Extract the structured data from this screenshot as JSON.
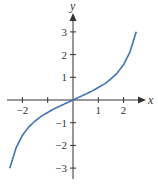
{
  "chart_data": {
    "type": "line",
    "title": "",
    "xlabel": "x",
    "ylabel": "y",
    "xlim": [
      -2.6,
      2.8
    ],
    "ylim": [
      -3.5,
      3.7
    ],
    "grid": false,
    "legend": null,
    "x_ticks": [
      -2,
      -1,
      1,
      2
    ],
    "x_tick_labels": [
      "−2",
      "",
      "1",
      "2"
    ],
    "y_ticks": [
      -3,
      -2,
      -1,
      1,
      2,
      3
    ],
    "y_tick_labels": [
      "−3",
      "−2",
      "−1",
      "1",
      "2",
      "3"
    ],
    "series": [
      {
        "name": "curve",
        "color": "#3f74b5",
        "x": [
          -2.5,
          -2.25,
          -2.0,
          -1.75,
          -1.5,
          -1.25,
          -1.0,
          -0.75,
          -0.5,
          -0.25,
          0.0,
          0.25,
          0.5,
          0.75,
          1.0,
          1.25,
          1.5,
          1.75,
          2.0,
          2.25,
          2.5
        ],
        "y": [
          -3.01,
          -2.11,
          -1.56,
          -1.19,
          -0.93,
          -0.71,
          -0.55,
          -0.39,
          -0.26,
          -0.13,
          0.0,
          0.13,
          0.26,
          0.39,
          0.55,
          0.71,
          0.93,
          1.19,
          1.56,
          2.11,
          3.01
        ]
      }
    ]
  },
  "colors": {
    "axis": "#333333",
    "curve": "#3f74b5"
  }
}
